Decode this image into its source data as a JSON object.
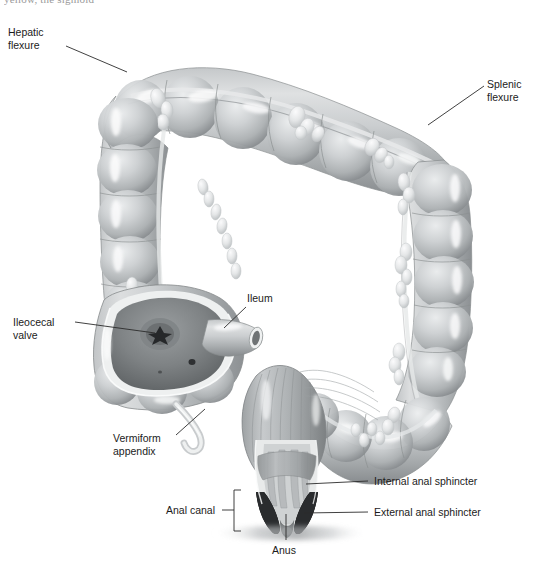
{
  "page": {
    "width": 537,
    "height": 570,
    "background": "#ffffff",
    "cropped_header_text": "yellow, the sigmoid",
    "figure_subject": "large-intestine-anatomy"
  },
  "colors": {
    "ink": "#1b1b1b",
    "leader_line": "#2b2b2b",
    "tissue_light": "#d7d9da",
    "tissue_mid": "#b7babc",
    "tissue_dark": "#8d9193",
    "tissue_shadow": "#6e7375",
    "lumen_dark": "#5a5e60",
    "highlight": "#f4f5f6",
    "appendage_fat": "#e9eaeb",
    "deep_black": "#232526"
  },
  "labels": [
    {
      "id": "hepatic-flexure",
      "text": "Hepatic\nflexure",
      "x": 8,
      "y": 26,
      "align": "left",
      "leader": {
        "x1": 66,
        "y1": 46,
        "x2": 127,
        "y2": 72
      }
    },
    {
      "id": "splenic-flexure",
      "text": "Splenic\nflexure",
      "x": 487,
      "y": 78,
      "align": "left",
      "leader": {
        "x1": 484,
        "y1": 86,
        "x2": 428,
        "y2": 125
      }
    },
    {
      "id": "ileocecal-valve",
      "text": "Ileocecal\nvalve",
      "x": 13,
      "y": 316,
      "align": "left",
      "leader": {
        "x1": 75,
        "y1": 322,
        "x2": 145,
        "y2": 331
      }
    },
    {
      "id": "ileum",
      "text": "Ileum",
      "x": 247,
      "y": 292,
      "align": "left",
      "leader": {
        "x1": 246,
        "y1": 307,
        "x2": 224,
        "y2": 327
      }
    },
    {
      "id": "vermiform-appendix",
      "text": "Vermiform\nappendix",
      "x": 113,
      "y": 432,
      "align": "left",
      "leader": {
        "x1": 176,
        "y1": 435,
        "x2": 203,
        "y2": 411
      }
    },
    {
      "id": "internal-anal-sphincter",
      "text": "Internal anal sphincter",
      "x": 371,
      "y": 475,
      "align": "left",
      "leader": {
        "x1": 368,
        "y1": 481,
        "x2": 310,
        "y2": 484
      }
    },
    {
      "id": "external-anal-sphincter",
      "text": "External anal sphincter",
      "x": 371,
      "y": 506,
      "align": "left",
      "leader": {
        "x1": 368,
        "y1": 512,
        "x2": 308,
        "y2": 513
      }
    },
    {
      "id": "anal-canal",
      "text": "Anal canal",
      "x": 166,
      "y": 504,
      "align": "left",
      "leader": {
        "x1": 222,
        "y1": 510,
        "x2": 234,
        "y2": 510
      },
      "bracket": {
        "x": 234,
        "y": 491,
        "width": 7,
        "height": 41
      }
    },
    {
      "id": "anus",
      "text": "Anus",
      "x": 272,
      "y": 544,
      "align": "left",
      "leader": {
        "x1": 286,
        "y1": 540,
        "x2": 286,
        "y2": 514
      }
    }
  ],
  "anatomy_parts": [
    "ascending-colon",
    "transverse-colon",
    "descending-colon",
    "sigmoid-colon",
    "cecum",
    "ileocecal-valve",
    "ileum",
    "vermiform-appendix",
    "hepatic-flexure",
    "splenic-flexure",
    "rectum",
    "anal-canal",
    "internal-anal-sphincter",
    "external-anal-sphincter",
    "anus",
    "haustra",
    "epiploic-appendages",
    "teniae-coli"
  ]
}
